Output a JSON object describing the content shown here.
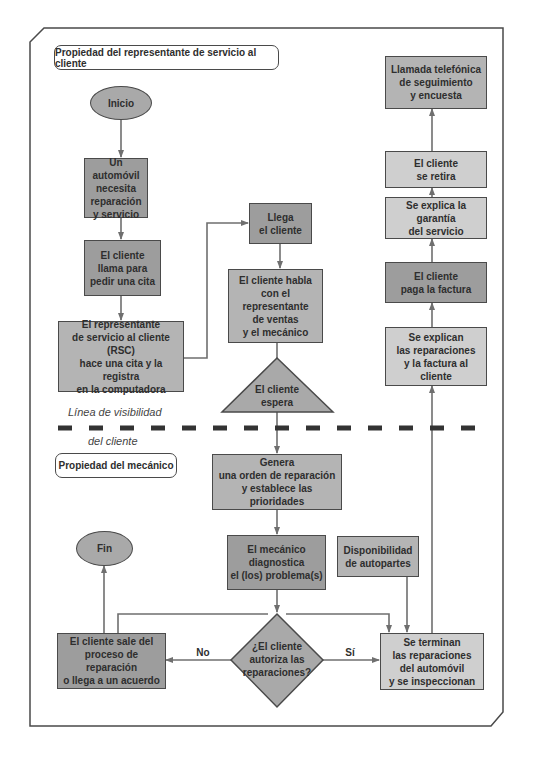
{
  "colors": {
    "line": "#6f6f6f",
    "frame": "#4a4a4a",
    "dark_fill": "#9d9d9d",
    "mid_fill": "#b4b4b4",
    "light_fill": "#cfcfcf",
    "dash": "#333333"
  },
  "sections": {
    "customer_service_rep": "Propiedad del representante de servicio al cliente",
    "mechanic": "Propiedad del mecánico"
  },
  "visibility_line": {
    "top_label": "Línea de visibilidad",
    "bottom_label": "del cliente"
  },
  "nodes": {
    "start": "Inicio",
    "car_needs_service": "Un automóvil\nnecesita\nreparación\ny servicio",
    "customer_calls": "El cliente\nllama para\npedir una cita",
    "rsc_books": "El representante\nde servicio al cliente (RSC)\nhace una cita y la registra\nen la computadora",
    "customer_arrives": "Llega\nel cliente",
    "customer_talks": "El cliente habla\ncon el representante\nde ventas\ny el mecánico",
    "customer_waits": "El cliente\nespera",
    "follow_up_call": "Llamada telefónica\nde seguimiento\ny encuesta",
    "customer_leaves": "El cliente\nse retira",
    "warranty_explained": "Se explica la garantía\ndel servicio",
    "customer_pays": "El cliente\npaga la factura",
    "repairs_explained": "Se explican\nlas reparaciones\ny la factura al cliente",
    "work_order": "Genera\nuna orden de reparación\ny establece las prioridades",
    "diagnosis": "El mecánico\ndiagnostica\nel (los) problema(s)",
    "end": "Fin",
    "parts_availability": "Disponibilidad\nde autopartes",
    "authorize_decision": "¿El cliente\nautoriza las\nreparaciones?",
    "customer_exits": "El cliente sale del\nproceso de reparación\no llega a un acuerdo",
    "repairs_done": "Se terminan\nlas reparaciones\ndel automóvil\ny se inspeccionan"
  },
  "edge_labels": {
    "no": "No",
    "yes": "Sí"
  }
}
